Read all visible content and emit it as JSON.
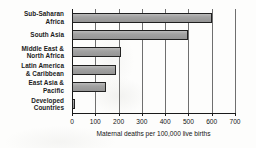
{
  "chart_data": {
    "type": "bar",
    "orientation": "horizontal",
    "title": "",
    "xlabel": "Maternal deaths per 100,000 live births",
    "ylabel": "",
    "categories": [
      "Sub-Saharan\nAfrica",
      "South Asia",
      "Middle East &\nNorth Africa",
      "Latin America\n& Caribbean",
      "East Asia &\nPacific",
      "Developed\nCountries"
    ],
    "values": [
      600,
      500,
      210,
      190,
      145,
      13
    ],
    "xlim": [
      0,
      700
    ],
    "xticks": [
      0,
      100,
      200,
      300,
      400,
      500,
      600,
      700
    ],
    "xtick_labels": [
      "0",
      "100",
      "200",
      "300",
      "400",
      "500",
      "600",
      "700"
    ],
    "grid": true,
    "grid_axis": "x",
    "legend": false,
    "bar_color": "#9d9d9d",
    "bar_edge_color": "#1f1f1f",
    "background_color": "#fdfdfc",
    "axis_color": "#1a1a1a"
  }
}
